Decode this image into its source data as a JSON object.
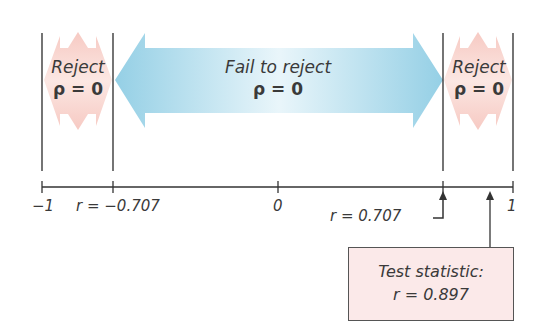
{
  "diagram": {
    "regions": {
      "left_reject": {
        "line1": "Reject",
        "line2": "ρ = 0"
      },
      "fail_to_reject": {
        "line1": "Fail to reject",
        "line2": "ρ = 0"
      },
      "right_reject": {
        "line1": "Reject",
        "line2": "ρ = 0"
      }
    },
    "axis": {
      "ticks": [
        {
          "label": "−1",
          "value": -1
        },
        {
          "label": "r = −0.707",
          "value": -0.707
        },
        {
          "label": "0",
          "value": 0
        },
        {
          "label": "r = 0.707",
          "value": 0.707
        },
        {
          "label": "1",
          "value": 1
        }
      ]
    },
    "test_statistic": {
      "line1": "Test statistic:",
      "line2": "r = 0.897",
      "value": 0.897
    },
    "colors": {
      "reject_region": "#f6c9c4",
      "fail_region": "#a9d8ea",
      "critical_label": "#e48aa6",
      "box_fill": "#fbe9e9"
    }
  }
}
